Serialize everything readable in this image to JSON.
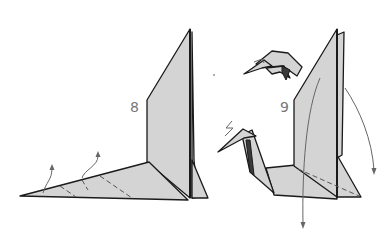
{
  "diagram": {
    "type": "origami-instruction",
    "steps": [
      {
        "number": "8",
        "description": "Base with tall vertical flap; two valley-fold arrows lifting the long pointed flap"
      },
      {
        "number": "9",
        "description": "Neck and head formed (swan/bird shape); inset detail of head; arrows folding wing flaps down"
      }
    ],
    "colors": {
      "paper": "#d4d4d4",
      "outline": "#1a1a1a",
      "arrow": "#666666"
    }
  }
}
